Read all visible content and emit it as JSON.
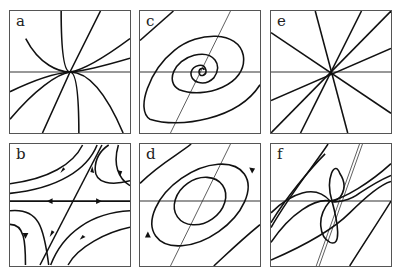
{
  "figure": {
    "panels": [
      {
        "id": "a",
        "label": "a",
        "type": "node (tangent trajectories)"
      },
      {
        "id": "b",
        "label": "b",
        "type": "saddle"
      },
      {
        "id": "c",
        "label": "c",
        "type": "spiral"
      },
      {
        "id": "d",
        "label": "d",
        "type": "center"
      },
      {
        "id": "e",
        "label": "e",
        "type": "star node"
      },
      {
        "id": "f",
        "label": "f",
        "type": "degenerate node"
      }
    ]
  }
}
